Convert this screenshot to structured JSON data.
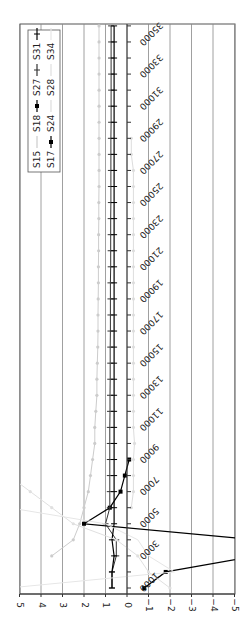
{
  "chart_data": {
    "type": "line",
    "orientation": "rotated-90",
    "title": "",
    "xlabel": "",
    "ylabel": "",
    "ylim": [
      -5,
      5
    ],
    "y_ticks": [
      5,
      4,
      3,
      2,
      1,
      0,
      -1,
      -2,
      -3,
      -4,
      -5
    ],
    "x_tick_labels": [
      "1000",
      "3000",
      "5000",
      "7000",
      "9000",
      "11000",
      "13000",
      "15000",
      "17000",
      "19000",
      "21000",
      "23000",
      "25000",
      "27000",
      "29000",
      "31000",
      "33000",
      "35000"
    ],
    "x": [
      1000,
      2000,
      3000,
      4000,
      5000,
      6000,
      7000,
      8000,
      9000,
      10000,
      11000,
      12000,
      13000,
      14000,
      15000,
      16000,
      17000,
      18000,
      19000,
      20000,
      21000,
      22000,
      23000,
      24000,
      25000,
      26000,
      27000,
      28000,
      29000,
      30000,
      31000,
      32000,
      33000,
      34000,
      35000,
      36000
    ],
    "grid": true,
    "legend_position": "top-right",
    "legend": [
      "S15",
      "S18",
      "S27",
      "S31",
      "S17",
      "S24",
      "S28",
      "S34"
    ],
    "series": [
      {
        "name": "S15",
        "color": "#cccccc",
        "marker": "dot",
        "values": [
          null,
          null,
          3.5,
          2.5,
          2.2,
          2.0,
          1.8,
          1.7,
          1.6,
          1.5,
          1.5,
          1.45,
          1.4,
          1.4,
          1.38,
          1.36,
          1.35,
          1.35,
          1.34,
          1.33,
          1.33,
          1.32,
          1.32,
          1.31,
          1.31,
          1.3,
          1.3,
          1.3,
          1.3,
          1.3,
          1.3,
          1.3,
          1.3,
          1.3,
          1.3,
          1.3
        ]
      },
      {
        "name": "S18",
        "color": "#000000",
        "marker": "square",
        "values": [
          null,
          null,
          null,
          -6,
          2.0,
          0.8,
          0.3,
          0.1,
          -0.1,
          null,
          null,
          null,
          null,
          null,
          null,
          null,
          null,
          null,
          null,
          null,
          null,
          null,
          null,
          null,
          null,
          null,
          null,
          null,
          null,
          null,
          null,
          null,
          null,
          null,
          null,
          null
        ]
      },
      {
        "name": "S27",
        "color": "#333333",
        "marker": "tick",
        "values": [
          0.7,
          0.7,
          0.5,
          0.5,
          1.0,
          0.8,
          0.8,
          0.8,
          0.8,
          0.8,
          0.8,
          0.79,
          0.79,
          0.78,
          0.78,
          0.78,
          0.77,
          0.77,
          0.77,
          0.77,
          0.76,
          0.76,
          0.76,
          0.76,
          0.75,
          0.75,
          0.75,
          0.75,
          0.75,
          0.74,
          0.74,
          0.74,
          0.74,
          0.74,
          0.74,
          0.74
        ]
      },
      {
        "name": "S31",
        "color": "#000000",
        "marker": "plus",
        "values": [
          0.7,
          0.7,
          0.6,
          0.7,
          0.6,
          0.6,
          0.6,
          0.6,
          0.6,
          0.6,
          0.6,
          0.6,
          0.6,
          0.6,
          0.6,
          0.6,
          0.6,
          0.6,
          0.6,
          0.6,
          0.6,
          0.6,
          0.6,
          0.6,
          0.6,
          0.6,
          0.6,
          0.6,
          0.6,
          0.6,
          0.6,
          0.6,
          0.6,
          0.6,
          0.6,
          0.6
        ]
      },
      {
        "name": "S17",
        "color": "#000000",
        "marker": "square",
        "values": [
          -0.8,
          -1.8,
          -6,
          null,
          null,
          null,
          null,
          null,
          null,
          null,
          null,
          null,
          null,
          null,
          null,
          null,
          null,
          null,
          null,
          null,
          null,
          null,
          null,
          null,
          null,
          null,
          null,
          null,
          null,
          null,
          null,
          null,
          null,
          null,
          null,
          null
        ]
      },
      {
        "name": "S24",
        "color": "#dddddd",
        "marker": "dot",
        "values": [
          null,
          null,
          null,
          null,
          null,
          -0.2,
          -0.3,
          -0.3,
          -0.3,
          -0.35,
          -0.3,
          -0.3,
          -0.3,
          -0.3,
          -0.3,
          -0.3,
          -0.3,
          -0.3,
          -0.3,
          -0.3,
          -0.3,
          -0.3,
          -0.3,
          -0.3,
          -0.3,
          -0.3,
          -0.3,
          -0.2,
          -0.2,
          null,
          null,
          null,
          null,
          null,
          null,
          null
        ]
      },
      {
        "name": "S28",
        "color": "#e0e0e0",
        "marker": "dot",
        "values": [
          -2.0,
          -1.0,
          -0.5,
          0.5,
          2.5,
          3.5,
          4.5,
          5.5,
          null,
          null,
          null,
          null,
          null,
          null,
          null,
          null,
          null,
          null,
          null,
          null,
          null,
          null,
          null,
          null,
          null,
          null,
          null,
          null,
          null,
          null,
          null,
          null,
          null,
          null,
          null,
          null
        ]
      },
      {
        "name": "S34",
        "color": "#e6e6e6",
        "marker": "none",
        "values": [
          5.5,
          -2.2,
          -1.0,
          -0.5,
          1.0,
          5.5,
          null,
          null,
          5.5,
          null,
          null,
          null,
          null,
          null,
          null,
          null,
          null,
          null,
          null,
          null,
          null,
          null,
          null,
          null,
          null,
          null,
          null,
          null,
          null,
          null,
          null,
          null,
          null,
          null,
          null,
          null
        ]
      }
    ]
  }
}
